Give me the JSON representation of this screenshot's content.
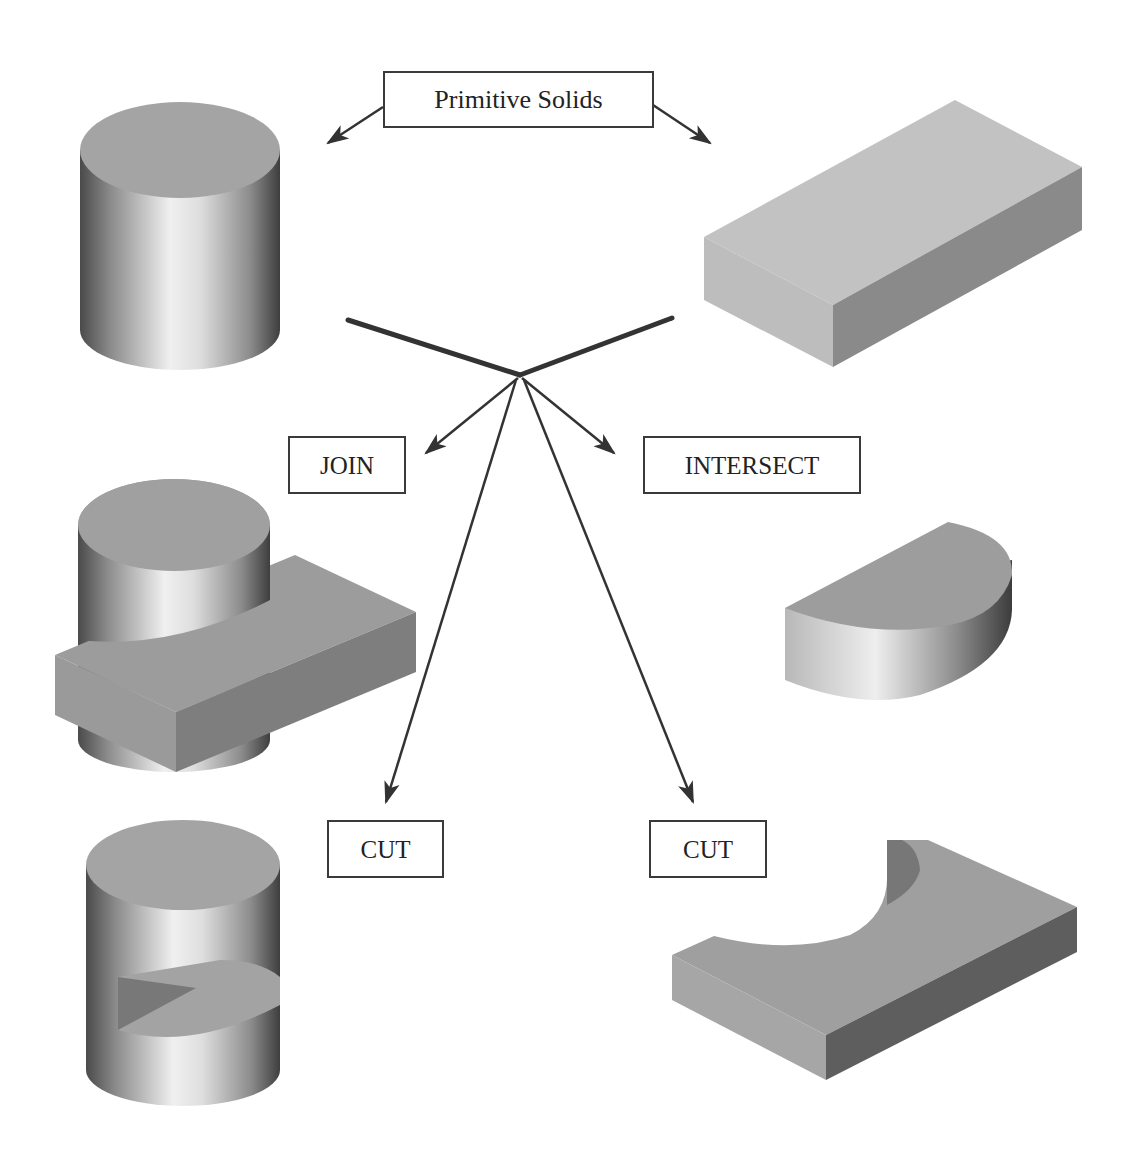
{
  "diagram": {
    "title_label": "Primitive Solids",
    "operations": {
      "join": "JOIN",
      "intersect": "INTERSECT",
      "cut_left": "CUT",
      "cut_right": "CUT"
    },
    "shapes": {
      "primitive_cylinder": "cylinder",
      "primitive_box": "rectangular block",
      "join_result": "cylinder joined with block",
      "intersect_result": "half-cylinder (intersection)",
      "cut_left_result": "cylinder minus block",
      "cut_right_result": "block minus cylinder"
    },
    "colors": {
      "line": "#333333",
      "face_top": "#a6a6a6",
      "face_light": "#c8c8c8",
      "face_dark": "#7a7a7a",
      "highlight": "#ededed"
    }
  }
}
